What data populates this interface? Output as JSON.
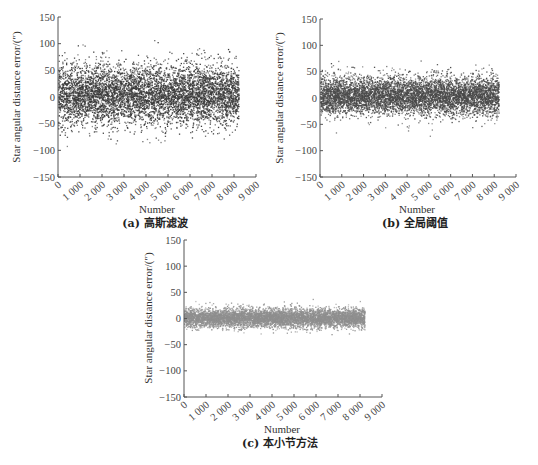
{
  "chart_data": [
    {
      "id": "a",
      "type": "scatter",
      "caption": "(a) 高斯滤波",
      "xlabel": "Number",
      "ylabel": "Star angular distance error/(″)",
      "xlim": [
        0,
        9000
      ],
      "ylim": [
        -150,
        150
      ],
      "xticks": [
        0,
        1000,
        2000,
        3000,
        4000,
        5000,
        6000,
        7000,
        8000,
        9000
      ],
      "xtick_labels": [
        "0",
        "1 000",
        "2 000",
        "3 000",
        "4 000",
        "5 000",
        "6 000",
        "7 000",
        "8 000",
        "9 000"
      ],
      "yticks": [
        150,
        100,
        50,
        0,
        -50,
        -100,
        -150
      ],
      "ytick_labels": [
        "150",
        "100",
        "50",
        "0",
        "−50",
        "−100",
        "−150"
      ],
      "grid": false,
      "legend": null,
      "point_color": "#3a3a3a",
      "series": [
        {
          "name": "Gaussian filtering error",
          "n_points": 8200,
          "x_range": [
            0,
            8200
          ],
          "mean": 5,
          "std": 28,
          "approx_min": -95,
          "approx_max": 107
        }
      ]
    },
    {
      "id": "b",
      "type": "scatter",
      "caption": "(b) 全局阈值",
      "xlabel": "Number",
      "ylabel": "Star angular distance error/(″)",
      "xlim": [
        0,
        9000
      ],
      "ylim": [
        -150,
        150
      ],
      "xticks": [
        0,
        1000,
        2000,
        3000,
        4000,
        5000,
        6000,
        7000,
        8000,
        9000
      ],
      "xtick_labels": [
        "0",
        "1 000",
        "2 000",
        "3 000",
        "4 000",
        "5 000",
        "6 000",
        "7 000",
        "8 000",
        "9 000"
      ],
      "yticks": [
        150,
        100,
        50,
        0,
        -50,
        -100,
        -150
      ],
      "ytick_labels": [
        "150",
        "100",
        "50",
        "0",
        "−50",
        "−100",
        "−150"
      ],
      "grid": false,
      "legend": null,
      "point_color": "#4a4a4a",
      "series": [
        {
          "name": "Global threshold error",
          "n_points": 8200,
          "x_range": [
            0,
            8200
          ],
          "mean": 5,
          "std": 18,
          "approx_min": -72,
          "approx_max": 80
        }
      ]
    },
    {
      "id": "c",
      "type": "scatter",
      "caption": "(c) 本小节方法",
      "xlabel": "Number",
      "ylabel": "Star angular distance error/(″)",
      "xlim": [
        0,
        9000
      ],
      "ylim": [
        -150,
        150
      ],
      "xticks": [
        0,
        1000,
        2000,
        3000,
        4000,
        5000,
        6000,
        7000,
        8000,
        9000
      ],
      "xtick_labels": [
        "0",
        "1 000",
        "2 000",
        "3 000",
        "4 000",
        "5 000",
        "6 000",
        "7 000",
        "8 000",
        "9 000"
      ],
      "yticks": [
        150,
        100,
        50,
        0,
        -50,
        -100,
        -150
      ],
      "ytick_labels": [
        "150",
        "100",
        "50",
        "0",
        "−50",
        "−100",
        "−150"
      ],
      "grid": false,
      "legend": null,
      "point_color": "#8f8f8f",
      "series": [
        {
          "name": "Proposed method error",
          "n_points": 8200,
          "x_range": [
            0,
            8200
          ],
          "mean": 2,
          "std": 9,
          "approx_min": -38,
          "approx_max": 50
        }
      ]
    }
  ]
}
